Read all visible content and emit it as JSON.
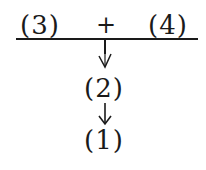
{
  "diagram": {
    "top_left_label": "(3)",
    "operator": "+",
    "top_right_label": "(4)",
    "middle_label": "(2)",
    "bottom_label": "(1)",
    "arrow_1": "down-arrow",
    "arrow_2": "down-arrow",
    "colors": {
      "ink": "#1a1a1a",
      "background": "#ffffff"
    }
  }
}
